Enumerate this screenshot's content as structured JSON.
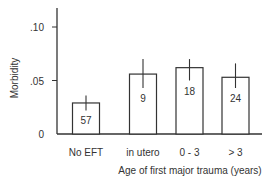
{
  "chart_data": {
    "type": "bar",
    "title": "",
    "xlabel": "Age of first major trauma (years)",
    "ylabel": "Morbidity",
    "ylim": [
      0,
      0.115
    ],
    "yticks": [
      {
        "value": 0,
        "label": "0"
      },
      {
        "value": 0.05,
        "label": ".05"
      },
      {
        "value": 0.1,
        "label": ".10"
      }
    ],
    "grid": false,
    "legend": null,
    "categories": [
      "No EFT",
      "in utero",
      "0 - 3",
      "> 3"
    ],
    "values": [
      0.029,
      0.056,
      0.062,
      0.053
    ],
    "error_upper": [
      0.036,
      0.07,
      0.07,
      0.066
    ],
    "error_lower": [
      0.022,
      0.043,
      0.05,
      0.043
    ],
    "bar_labels": [
      "57",
      "9",
      "18",
      "24"
    ],
    "bar_label_meaning": "sample size (n) per group",
    "colors": {
      "bar_fill": "#ffffff",
      "bar_stroke": "#333333",
      "axis": "#333333",
      "text": "#333333"
    }
  }
}
